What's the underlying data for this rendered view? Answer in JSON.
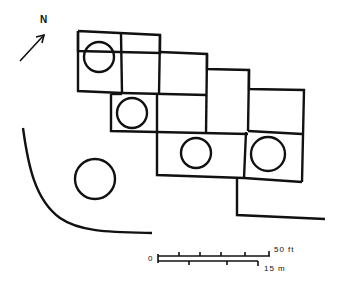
{
  "diagram": {
    "type": "site-plan",
    "north_label": "N",
    "scale": {
      "zero_label": "0",
      "feet_label": "50 ft",
      "meters_label": "15 m"
    },
    "features": {
      "rooms": 11,
      "circular_features": 6,
      "curved_wall": 1
    }
  }
}
